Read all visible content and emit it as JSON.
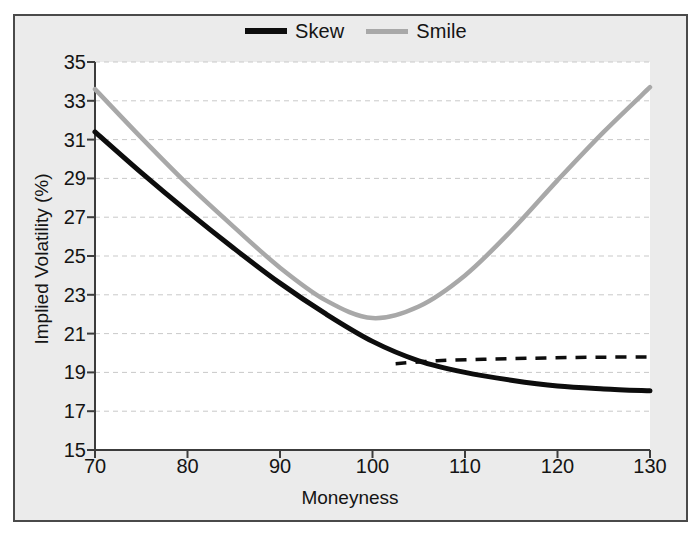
{
  "figure": {
    "background_color": "#ebebeb",
    "plot_background_color": "#ffffff",
    "border_color": "#4a4a4a"
  },
  "chart_data": {
    "type": "line",
    "title": "",
    "xlabel": "Moneyness",
    "ylabel": "Implied Volatility (%)",
    "xlim": [
      70,
      130
    ],
    "ylim": [
      15,
      35
    ],
    "xticks": [
      70,
      80,
      90,
      100,
      110,
      120,
      130
    ],
    "yticks": [
      15,
      17,
      19,
      21,
      23,
      25,
      27,
      29,
      31,
      33,
      35
    ],
    "grid": "horizontal-dashed",
    "legend_position": "top-center",
    "series": [
      {
        "name": "Skew",
        "color": "#0d0d0d",
        "style": "solid",
        "width": 5,
        "x": [
          70,
          75,
          80,
          85,
          90,
          95,
          100,
          105,
          110,
          115,
          120,
          125,
          130
        ],
        "values": [
          31.4,
          29.3,
          27.3,
          25.4,
          23.6,
          22.0,
          20.6,
          19.6,
          19.0,
          18.6,
          18.3,
          18.15,
          18.05
        ]
      },
      {
        "name": "Smile",
        "color": "#a8a8a8",
        "style": "solid",
        "width": 4.5,
        "x": [
          70,
          75,
          80,
          85,
          90,
          95,
          100,
          105,
          110,
          115,
          120,
          125,
          130
        ],
        "values": [
          33.6,
          31.1,
          28.7,
          26.5,
          24.4,
          22.7,
          21.8,
          22.4,
          24.0,
          26.3,
          28.9,
          31.4,
          33.7
        ]
      },
      {
        "name": "Flat extrapolation",
        "color": "#0d0d0d",
        "style": "dashed",
        "width": 3.5,
        "in_legend": false,
        "x": [
          102.5,
          107,
          112,
          117,
          122,
          126,
          130
        ],
        "values": [
          19.45,
          19.6,
          19.68,
          19.73,
          19.77,
          19.79,
          19.8
        ]
      }
    ]
  },
  "legend": {
    "entries": [
      {
        "label": "Skew",
        "swatch": "skew"
      },
      {
        "label": "Smile",
        "swatch": "smile"
      }
    ]
  }
}
